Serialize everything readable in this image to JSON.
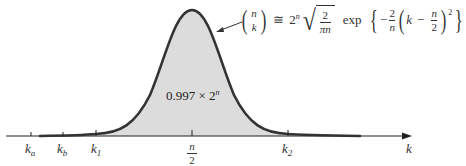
{
  "diagram": {
    "type": "binomial coefficient gaussian approximation",
    "axis": {
      "variable": "k",
      "ticks": [
        {
          "id": "ka",
          "base": "k",
          "sub": "a",
          "x": 31
        },
        {
          "id": "kb",
          "base": "k",
          "sub": "b",
          "x": 63
        },
        {
          "id": "k1",
          "base": "k",
          "sub": "1",
          "x": 96
        },
        {
          "id": "center",
          "num": "n",
          "den": "2",
          "x": 192
        },
        {
          "id": "k2",
          "base": "k",
          "sub": "2",
          "x": 288
        }
      ]
    },
    "area_label": {
      "coef": "0.997 × 2",
      "exp": "n"
    },
    "formula": {
      "binom_top": "n",
      "binom_bottom": "k",
      "approx": "≅",
      "two_pow": "2",
      "two_pow_exp": "n",
      "sqrt_num": "2",
      "sqrt_den": "πn",
      "exp_word": "exp",
      "minus": "−",
      "frac_num": "2",
      "frac_den": "n",
      "k": "k",
      "inner_minus": "−",
      "half_num": "n",
      "half_den": "2",
      "square": "2"
    },
    "colors": {
      "curve": "#333333",
      "fill": "#dcdcdc",
      "axis": "#222222"
    }
  }
}
